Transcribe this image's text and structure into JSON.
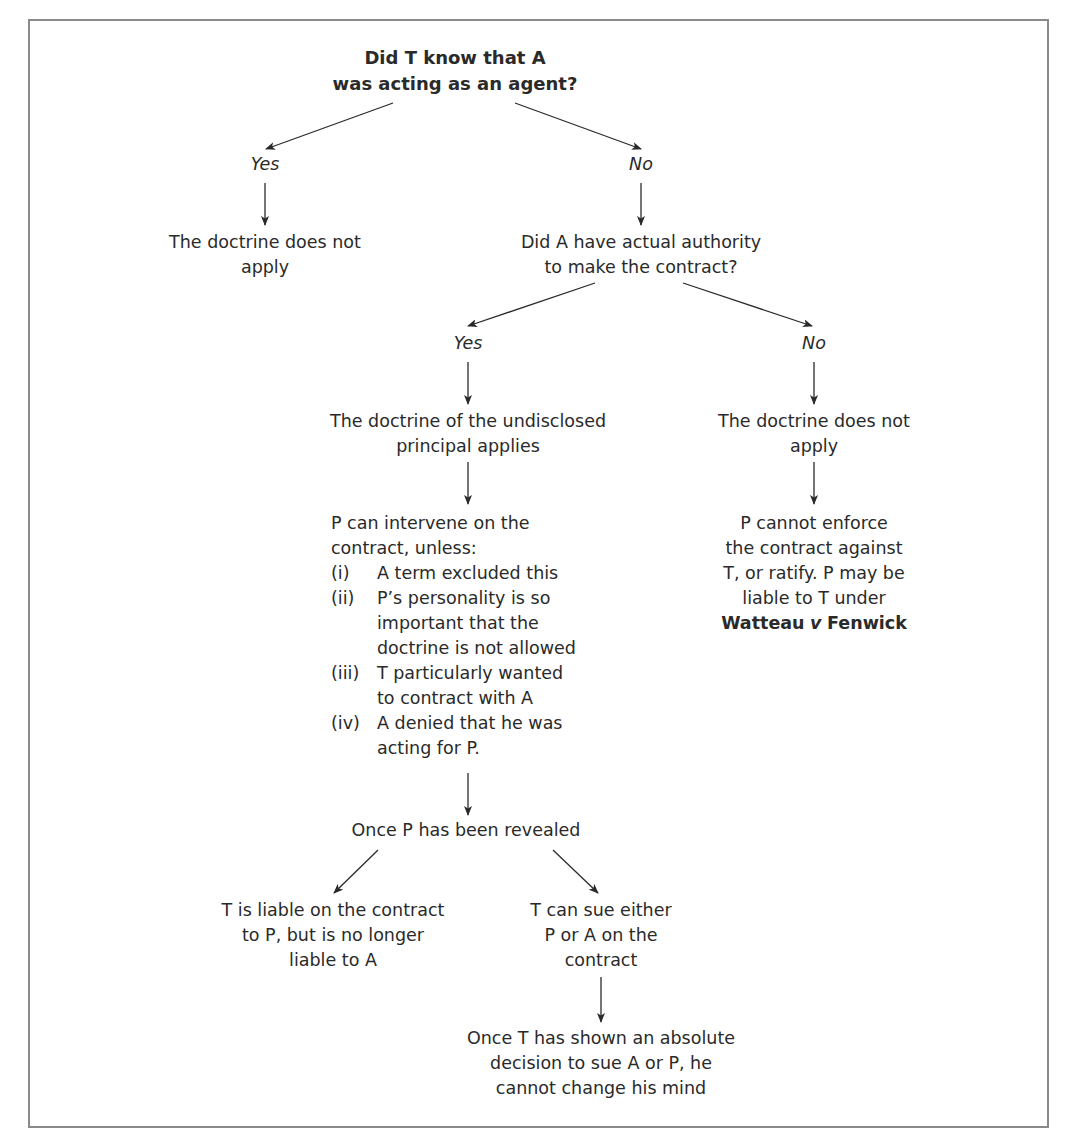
{
  "diagram": {
    "type": "flowchart",
    "root_question": {
      "line1": "Did T know that A",
      "line2": "was acting as an agent?"
    },
    "branch1": {
      "yes_label": "Yes",
      "no_label": "No",
      "yes_outcome": {
        "line1": "The doctrine does not",
        "line2": "apply"
      },
      "no_question": {
        "line1": "Did A have actual authority",
        "line2": "to make the contract?"
      }
    },
    "branch2": {
      "yes_label": "Yes",
      "no_label": "No",
      "yes_outcome": {
        "line1": "The doctrine of the undisclosed",
        "line2": "principal applies"
      },
      "no_outcome": {
        "line1": "The doctrine does not",
        "line2": "apply"
      },
      "no_consequence": {
        "line1": "P cannot enforce",
        "line2": "the contract against",
        "line3": "T, or ratify. P may be",
        "line4": "liable to T under",
        "case_part1": "Watteau",
        "case_v": "v",
        "case_part2": "Fenwick"
      }
    },
    "intervention": {
      "intro_line1": "P can intervene on the",
      "intro_line2": "contract, unless:",
      "exceptions": [
        {
          "num": "(i)",
          "lines": [
            "A term excluded this"
          ]
        },
        {
          "num": "(ii)",
          "lines": [
            "P’s personality is so",
            "important that the",
            "doctrine is not allowed"
          ]
        },
        {
          "num": "(iii)",
          "lines": [
            "T particularly wanted",
            "to contract with A"
          ]
        },
        {
          "num": "(iv)",
          "lines": [
            "A denied that he was",
            "acting for P."
          ]
        }
      ]
    },
    "revealed": {
      "text": "Once P has been revealed",
      "left_outcome": {
        "line1": "T is liable on the contract",
        "line2": "to P, but is no longer",
        "line3": "liable to A"
      },
      "right_outcome": {
        "line1": "T can sue either",
        "line2": "P or A on the",
        "line3": "contract"
      },
      "final": {
        "line1": "Once T has shown an absolute",
        "line2": "decision to sue A or P, he",
        "line3": "cannot change his mind"
      }
    }
  },
  "colors": {
    "border": "#8a8a8a",
    "text": "#2a2a2a",
    "arrow": "#2a2a2a"
  }
}
